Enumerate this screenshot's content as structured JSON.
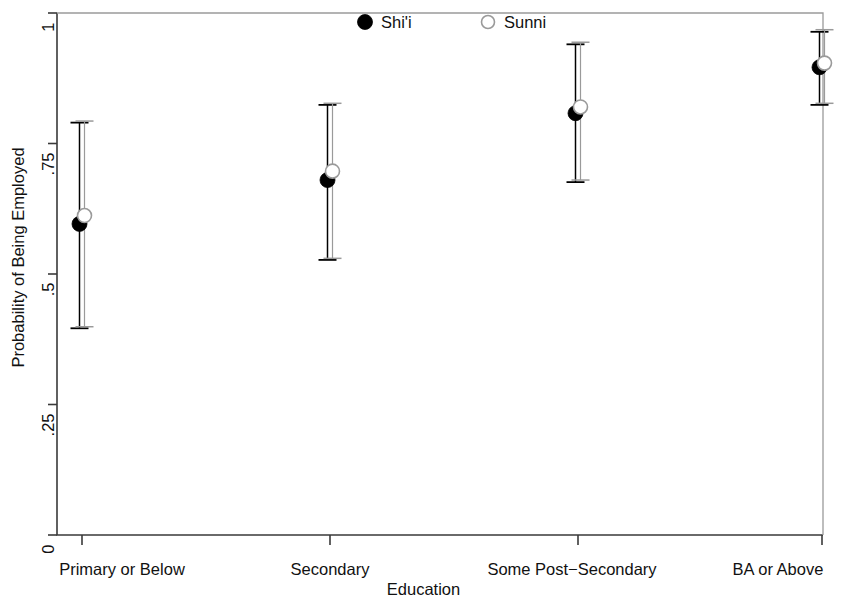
{
  "chart_data": {
    "type": "scatter",
    "title": "",
    "xlabel": "Education",
    "ylabel": "Probability of Being Employed",
    "categories": [
      "Primary or Below",
      "Secondary",
      "Some Post−Secondary",
      "BA or Above"
    ],
    "ytick_labels": [
      "0",
      ".25",
      ".5",
      ".75",
      "1"
    ],
    "ytick_values": [
      0,
      0.25,
      0.5,
      0.75,
      1
    ],
    "ylim": [
      0,
      1
    ],
    "grid": false,
    "legend_position": "top-center-inside",
    "series": [
      {
        "name": "Shi'i",
        "marker": "filled-circle",
        "color": "#000000",
        "values": [
          0.596,
          0.68,
          0.808,
          0.896
        ],
        "ci_low": [
          0.396,
          0.527,
          0.676,
          0.824
        ],
        "ci_high": [
          0.79,
          0.824,
          0.94,
          0.964
        ]
      },
      {
        "name": "Sunni",
        "marker": "open-circle",
        "color": "#9a9a9a",
        "values": [
          0.612,
          0.697,
          0.82,
          0.904
        ],
        "ci_low": [
          0.399,
          0.53,
          0.68,
          0.827
        ],
        "ci_high": [
          0.793,
          0.827,
          0.944,
          0.968
        ]
      }
    ]
  },
  "legend": {
    "items": [
      {
        "label": "Shi'i",
        "marker": "filled-circle"
      },
      {
        "label": "Sunni",
        "marker": "open-circle"
      }
    ]
  },
  "colors": {
    "axis": "#3a3a3a",
    "shii": "#000000",
    "sunni": "#9a9a9a",
    "background": "#ffffff"
  }
}
